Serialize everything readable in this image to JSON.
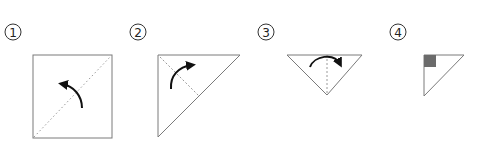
{
  "diagram": {
    "type": "origami-folding-steps",
    "colors": {
      "outline": "#7a7a7a",
      "fold_line": "#9a9a9a",
      "arrow": "#111111",
      "marker_fill": "#6b6b6b",
      "background": "#ffffff"
    },
    "steps": [
      {
        "number": "1",
        "shape": "square",
        "fold_line": "diagonal-dotted",
        "arrow": "curved-left"
      },
      {
        "number": "2",
        "shape": "right-triangle",
        "fold_line": "dashed-bisector",
        "arrow": "curved-right"
      },
      {
        "number": "3",
        "shape": "inverted-triangle",
        "fold_line": "dashed-vertical",
        "arrow": "curved-over-right"
      },
      {
        "number": "4",
        "shape": "small-right-triangle",
        "marker": "gray-square-corner"
      }
    ]
  }
}
